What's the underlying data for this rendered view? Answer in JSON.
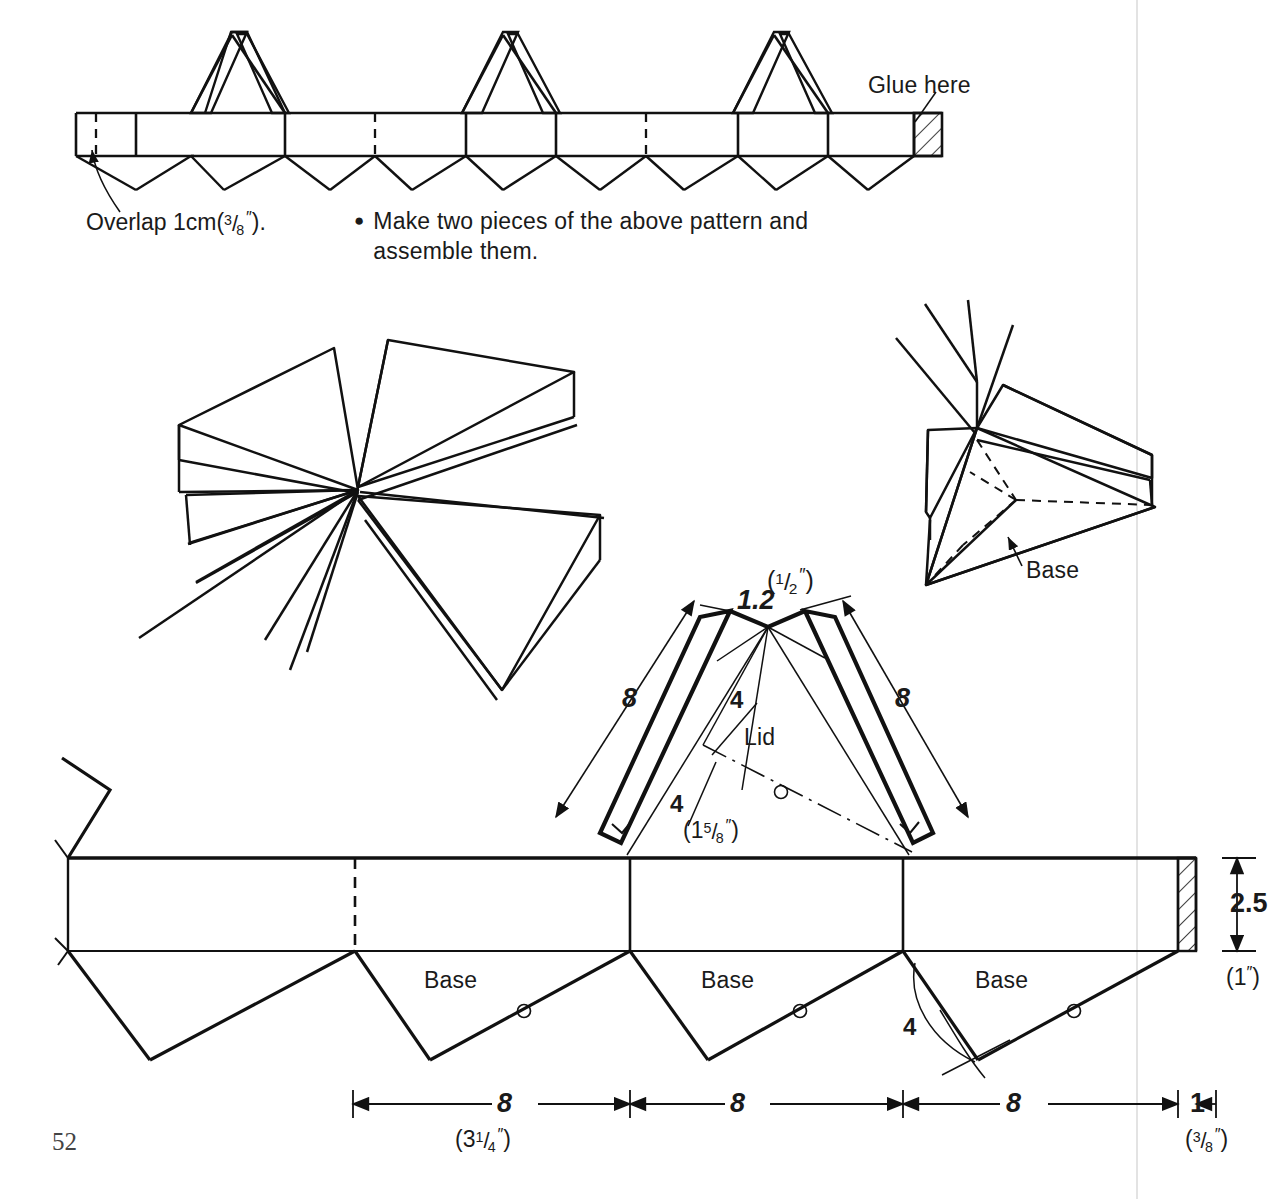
{
  "page": {
    "number": "52",
    "ink_color": "#111111",
    "paper_color": "#ffffff",
    "margin_line_color": "#e6e6e6"
  },
  "top_pattern": {
    "name": "lid-strip-pattern",
    "glue_label": "Glue here",
    "overlap_label_prefix": "Overlap 1cm",
    "overlap_label_paren_open": "(",
    "overlap_label_frac_num": "3",
    "overlap_label_frac_den": "8",
    "overlap_label_inch": "″",
    "overlap_label_paren_close": ").",
    "overlap_full_text": "Overlap 1cm (3/8″)."
  },
  "note": {
    "bullet": "●",
    "line1": "Make two pieces of the above pattern and",
    "line2": "assemble them."
  },
  "assembly_views": {
    "exploded_view_name": "exploded-lid-and-base-view",
    "folded_view_name": "folded-assembly-view",
    "folded_label": "Base"
  },
  "lid_pattern": {
    "name": "lid-detail-pattern",
    "label": "Lid",
    "apex_dim": "1.2",
    "apex_dim_paren_open": "(",
    "apex_dim_frac_num": "1",
    "apex_dim_frac_den": "2",
    "apex_dim_inch": "″",
    "apex_dim_paren_close": ")",
    "side_dim_left": "8",
    "side_dim_right": "8",
    "inner_dim_upper": "4",
    "inner_dim_lower": "4",
    "inner_dim_paren_open": "(",
    "inner_dim_whole": "1",
    "inner_dim_frac_num": "5",
    "inner_dim_frac_den": "8",
    "inner_dim_inch": "″",
    "inner_dim_paren_close": ")"
  },
  "base_pattern": {
    "name": "base-strip-pattern",
    "panel_labels": [
      "Base",
      "Base",
      "Base"
    ],
    "angle_dim": "4",
    "height_dim": "2.5",
    "height_dim_paren_open": "(",
    "height_dim_inch_value": "1",
    "height_dim_inch": "″",
    "height_dim_paren_close": ")",
    "width_dims": [
      "8",
      "8",
      "8",
      "1"
    ],
    "width_dim_first_paren_open": "(",
    "width_dim_first_whole": "3",
    "width_dim_first_frac_num": "1",
    "width_dim_first_frac_den": "4",
    "width_dim_first_inch": "″",
    "width_dim_first_paren_close": ")",
    "width_dim_last_paren_open": "(",
    "width_dim_last_frac_num": "3",
    "width_dim_last_frac_den": "8",
    "width_dim_last_inch": "″",
    "width_dim_last_paren_close": ")"
  }
}
